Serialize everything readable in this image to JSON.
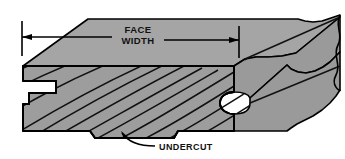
{
  "figure": {
    "background_color": "#ffffff",
    "outline_color": "#000000",
    "surfaces": {
      "top_face_color": "#a5a5a5",
      "end_grain_face_color": "#9d9d9d",
      "side_face_color": "#9a9a9a",
      "grain_line_color": "#111111"
    }
  },
  "dimension": {
    "label_line1": "FACE",
    "label_line2": "WIDTH",
    "arrow_style": "double-arrow-with-extension-lines",
    "left_extension_x": 22,
    "right_extension_x": 239,
    "dimension_line_y": 37
  },
  "callouts": [
    {
      "label": "UNDERCUT",
      "leader_style": "curved-arrow",
      "target": "bottom-edge-relief-step"
    }
  ],
  "features": {
    "left_edge": "groove",
    "right_edge": "rounded-tongue",
    "bottom_edge": "undercut-relief",
    "right_end": "wavy-break-line",
    "end_grain": "curved-growth-ring-lines"
  }
}
